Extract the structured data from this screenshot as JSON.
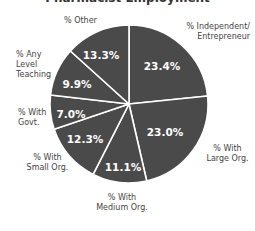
{
  "chart_data": {
    "type": "pie",
    "title": "Pharmacist Employment",
    "categories": [
      "% Independent/ Entrepreneur",
      "% With Large Org.",
      "% With Medium Org.",
      "% With Small Org.",
      "% With Govt.",
      "% Any Level Teaching",
      "% Other"
    ],
    "values": [
      23.4,
      23.0,
      11.1,
      12.3,
      7.0,
      9.9,
      13.3
    ],
    "value_labels": [
      "23.4%",
      "23.0%",
      "11.1%",
      "12.3%",
      "7.0%",
      "9.9%",
      "13.3%"
    ],
    "start_angle": "12 o'clock",
    "direction": "clockwise",
    "slice_color": "#4a4a4a",
    "separator_color": "#ffffff",
    "legend": "none (outside slice labels)"
  },
  "labels": {
    "independent": [
      "% Independent/",
      "Entrepreneur"
    ],
    "large": [
      "% With",
      "Large Org."
    ],
    "medium": [
      "% With",
      "Medium Org."
    ],
    "small": [
      "% With",
      "Small Org."
    ],
    "govt": [
      "% With",
      "Govt."
    ],
    "teaching": [
      "% Any",
      "Level",
      "Teaching"
    ],
    "other": [
      "% Other"
    ]
  }
}
